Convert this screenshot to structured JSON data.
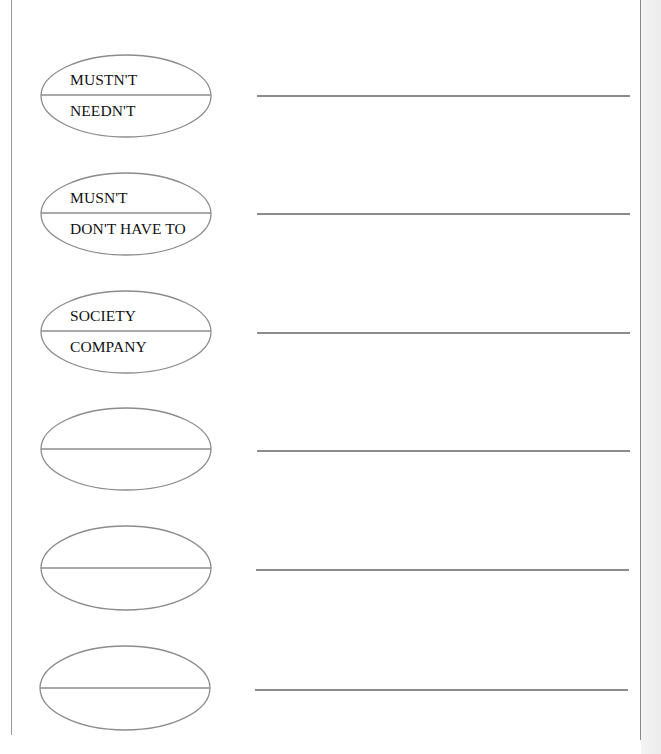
{
  "worksheet": {
    "items": [
      {
        "top_word": "MUSTN'T",
        "bottom_word": "NEEDN'T",
        "answer": ""
      },
      {
        "top_word": "MUSN'T",
        "bottom_word": "DON'T HAVE TO",
        "answer": ""
      },
      {
        "top_word": "SOCIETY",
        "bottom_word": "COMPANY",
        "answer": ""
      },
      {
        "top_word": "",
        "bottom_word": "",
        "answer": ""
      },
      {
        "top_word": "",
        "bottom_word": "",
        "answer": ""
      },
      {
        "top_word": "",
        "bottom_word": "",
        "answer": ""
      }
    ]
  },
  "colors": {
    "stroke": "#8c8c8c",
    "text": "#111111",
    "background": "#ffffff"
  }
}
